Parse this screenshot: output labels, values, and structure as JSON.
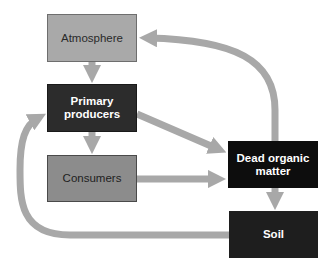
{
  "diagram": {
    "colors": {
      "arrow": "#a8a8a8",
      "atmosphere_fill": "#a9a9a9",
      "primary_producers_fill": "#2c2c2c",
      "consumers_fill": "#8c8c8c",
      "dead_organic_matter_fill": "#0d0d0d",
      "soil_fill": "#1e1e1e"
    },
    "nodes": [
      {
        "id": "atmosphere",
        "label": "Atmosphere"
      },
      {
        "id": "primary_producers",
        "label": "Primary producers"
      },
      {
        "id": "consumers",
        "label": "Consumers"
      },
      {
        "id": "dead_organic_matter",
        "label": "Dead organic matter"
      },
      {
        "id": "soil",
        "label": "Soil"
      }
    ],
    "edges": [
      {
        "from": "atmosphere",
        "to": "primary_producers"
      },
      {
        "from": "primary_producers",
        "to": "consumers"
      },
      {
        "from": "primary_producers",
        "to": "dead_organic_matter"
      },
      {
        "from": "consumers",
        "to": "dead_organic_matter"
      },
      {
        "from": "dead_organic_matter",
        "to": "atmosphere"
      },
      {
        "from": "dead_organic_matter",
        "to": "soil"
      },
      {
        "from": "soil",
        "to": "primary_producers"
      }
    ],
    "labels": {
      "atmosphere": "Atmosphere",
      "primary_producers": "Primary producers",
      "consumers": "Consumers",
      "dead_organic_matter": "Dead organic matter",
      "soil": "Soil"
    }
  }
}
